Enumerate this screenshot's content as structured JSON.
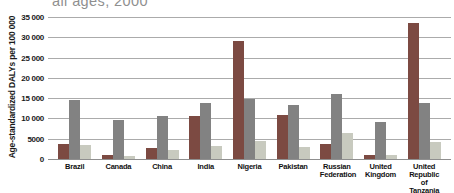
{
  "title_fragment": "all ages, 2000",
  "y_axis": {
    "label": "Age-standardized DALYs per 100 000",
    "ticks": [
      {
        "label": "35 000",
        "value": 35000
      },
      {
        "label": "30 000",
        "value": 30000
      },
      {
        "label": "25 000",
        "value": 25000
      },
      {
        "label": "20 000",
        "value": 20000
      },
      {
        "label": "15 000",
        "value": 15000
      },
      {
        "label": "10 000",
        "value": 10000
      },
      {
        "label": "5000",
        "value": 5000
      },
      {
        "label": "0",
        "value": 0
      }
    ]
  },
  "colors": {
    "series_dark_red": "#7c4a42",
    "series_gray": "#828282",
    "series_light_gray": "#c8cabf",
    "gridline": "#ababab",
    "axis_line": "#8f8f8f",
    "title_text": "#8f8f8f"
  },
  "chart_data": {
    "type": "bar",
    "title": "all ages, 2000",
    "xlabel": "",
    "ylabel": "Age-standardized DALYs per 100 000",
    "ylim": [
      0,
      35000
    ],
    "grid": true,
    "legend_position": "none",
    "categories": [
      "Brazil",
      "Canada",
      "China",
      "India",
      "Nigeria",
      "Pakistan",
      "Russian Federation",
      "United Kingdom",
      "United Republic of Tanzania"
    ],
    "series": [
      {
        "name": "dark-red",
        "color": "#7c4a42",
        "values": [
          3800,
          1100,
          2600,
          10700,
          29200,
          10800,
          3800,
          1100,
          33500
        ]
      },
      {
        "name": "gray",
        "color": "#828282",
        "values": [
          14600,
          9500,
          10700,
          13800,
          14900,
          13200,
          16100,
          9100,
          13700
        ]
      },
      {
        "name": "light-gray",
        "color": "#c8cabf",
        "values": [
          3400,
          700,
          2300,
          3300,
          4400,
          2900,
          6400,
          900,
          4100
        ]
      }
    ]
  }
}
